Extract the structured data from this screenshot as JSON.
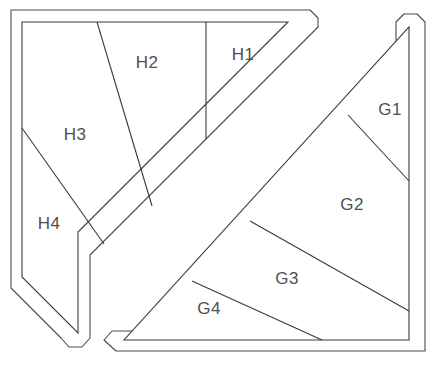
{
  "diagram": {
    "background_color": "#ffffff",
    "stroke_color": "#3a3a3a",
    "label_color": "#4f4f4f",
    "shapes": [
      {
        "name": "upper-left-triangle",
        "label_prefix": "H",
        "outer_path": "M 11,10 L 310,10 L 318,18 L 318,27 L 90,255 L 90,338 L 82,347 L 69,347 L 61,338 L 11,288 Z",
        "inner_path": "M 22,22 L 288,22 L 78,232 L 78,333 L 22,277 Z",
        "regions": [
          {
            "id": "H1",
            "label": "H1",
            "label_x": 243,
            "label_y": 56
          },
          {
            "id": "H2",
            "label": "H2",
            "label_x": 147,
            "label_y": 64
          },
          {
            "id": "H3",
            "label": "H3",
            "label_x": 75,
            "label_y": 136
          },
          {
            "id": "H4",
            "label": "H4",
            "label_x": 49,
            "label_y": 225
          }
        ],
        "dividers": [
          {
            "from": "H1-H2",
            "path": "M 206,22 L 206,139"
          },
          {
            "from": "H2-H3",
            "path": "M 97,22 L 152,206"
          },
          {
            "from": "H3-H4",
            "path": "M 22,128 L 104,244"
          }
        ]
      },
      {
        "name": "lower-right-triangle",
        "label_prefix": "G",
        "outer_path": "M 404,14 L 417,14 L 425,22 L 425,351 L 116,351 L 104,340 L 112,331 L 396,331 L 396,22 Z",
        "inner_path": "M 409,27 L 409,340 L 124,340 Z",
        "regions": [
          {
            "id": "G1",
            "label": "G1",
            "label_x": 390,
            "label_y": 111
          },
          {
            "id": "G2",
            "label": "G2",
            "label_x": 352,
            "label_y": 206
          },
          {
            "id": "G3",
            "label": "G3",
            "label_x": 287,
            "label_y": 280
          },
          {
            "id": "G4",
            "label": "G4",
            "label_x": 209,
            "label_y": 310
          }
        ],
        "dividers": [
          {
            "from": "G1-G2",
            "path": "M 348,115 L 409,181"
          },
          {
            "from": "G2-G3",
            "path": "M 250,221 L 409,311"
          },
          {
            "from": "G3-G4",
            "path": "M 192,281 L 322,340"
          }
        ]
      }
    ]
  }
}
